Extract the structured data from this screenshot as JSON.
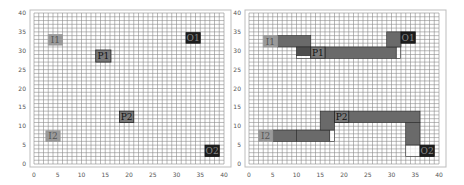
{
  "figure": {
    "panels": [
      {
        "id": "initial-placement",
        "axes": {
          "xlim": [
            0,
            40
          ],
          "ylim": [
            0,
            40
          ],
          "xticks": [
            0,
            5,
            10,
            15,
            20,
            25,
            30,
            35,
            40
          ],
          "yticks": [
            0,
            5,
            10,
            15,
            20,
            25,
            30,
            35,
            40
          ],
          "grid_step": 1
        },
        "blocks": [
          {
            "label": "I1",
            "x": 3,
            "y": 31.5,
            "w": 3,
            "h": 2.8,
            "fill": "#9a9a9a",
            "text": "#555555",
            "border": "#9a9a9a"
          },
          {
            "label": "P1",
            "x": 13,
            "y": 27,
            "w": 3.2,
            "h": 3.2,
            "fill": "#7a7a7a",
            "text": "#111111",
            "border": "#222222"
          },
          {
            "label": "O1",
            "x": 32,
            "y": 32,
            "w": 3,
            "h": 2.8,
            "fill": "#1e1e1e",
            "text": "#888888",
            "border": "#111111"
          },
          {
            "label": "P2",
            "x": 18,
            "y": 11,
            "w": 3,
            "h": 3,
            "fill": "#7a7a7a",
            "text": "#111111",
            "border": "#222222"
          },
          {
            "label": "I2",
            "x": 2.5,
            "y": 6,
            "w": 3,
            "h": 2.8,
            "fill": "#9a9a9a",
            "text": "#555555",
            "border": "#9a9a9a"
          },
          {
            "label": "O2",
            "x": 36,
            "y": 2,
            "w": 3,
            "h": 3,
            "fill": "#1e1e1e",
            "text": "#888888",
            "border": "#111111"
          }
        ]
      },
      {
        "id": "routed-placement",
        "axes": {
          "xlim": [
            0,
            40
          ],
          "ylim": [
            0,
            40
          ],
          "xticks": [
            0,
            5,
            10,
            15,
            20,
            25,
            30,
            35,
            40
          ],
          "yticks": [
            0,
            5,
            10,
            15,
            20,
            25,
            30,
            35,
            40
          ],
          "grid_step": 1
        },
        "routes": [
          {
            "x": 6,
            "y": 31,
            "w": 7,
            "h": 3,
            "fill": "#6a6a6a"
          },
          {
            "x": 10,
            "y": 28.7,
            "w": 3,
            "h": 2.3,
            "fill": "#4e4e4e"
          },
          {
            "x": 10,
            "y": 28,
            "w": 3,
            "h": 0.7,
            "fill": "#ffffff"
          },
          {
            "x": 16,
            "y": 28,
            "w": 15,
            "h": 3,
            "fill": "#6a6a6a"
          },
          {
            "x": 31,
            "y": 28,
            "w": 0.9,
            "h": 3,
            "fill": "#ffffff"
          },
          {
            "x": 29,
            "y": 31,
            "w": 3,
            "h": 4,
            "fill": "#6a6a6a"
          },
          {
            "x": 5,
            "y": 6,
            "w": 5,
            "h": 3,
            "fill": "#6a6a6a"
          },
          {
            "x": 10,
            "y": 6,
            "w": 7,
            "h": 3,
            "fill": "#6a6a6a"
          },
          {
            "x": 17,
            "y": 6,
            "w": 1,
            "h": 3,
            "fill": "#ffffff"
          },
          {
            "x": 15,
            "y": 9,
            "w": 3,
            "h": 5,
            "fill": "#6a6a6a"
          },
          {
            "x": 21,
            "y": 11,
            "w": 15,
            "h": 3,
            "fill": "#6a6a6a"
          },
          {
            "x": 33,
            "y": 5,
            "w": 3,
            "h": 6,
            "fill": "#6a6a6a"
          },
          {
            "x": 33,
            "y": 2,
            "w": 3,
            "h": 3,
            "fill": "#ffffff"
          }
        ],
        "blocks": [
          {
            "label": "I1",
            "x": 3,
            "y": 31,
            "w": 3,
            "h": 3,
            "fill": "#9a9a9a",
            "text": "#555555",
            "border": "#9a9a9a"
          },
          {
            "label": "P1",
            "x": 13,
            "y": 28,
            "w": 3,
            "h": 3,
            "fill": "#7a7a7a",
            "text": "#111111",
            "border": "#222222"
          },
          {
            "label": "O1",
            "x": 32,
            "y": 32,
            "w": 3,
            "h": 3,
            "fill": "#1e1e1e",
            "text": "#888888",
            "border": "#111111"
          },
          {
            "label": "P2",
            "x": 18,
            "y": 11,
            "w": 3,
            "h": 3,
            "fill": "#7a7a7a",
            "text": "#111111",
            "border": "#222222"
          },
          {
            "label": "I2",
            "x": 2,
            "y": 6,
            "w": 3,
            "h": 3,
            "fill": "#9a9a9a",
            "text": "#555555",
            "border": "#9a9a9a"
          },
          {
            "label": "O2",
            "x": 36,
            "y": 2,
            "w": 3,
            "h": 3,
            "fill": "#1e1e1e",
            "text": "#888888",
            "border": "#111111"
          }
        ]
      }
    ]
  },
  "colors": {
    "grid": "#8c8c8c",
    "frame": "#bdbdbd",
    "background": "#ffffff"
  }
}
